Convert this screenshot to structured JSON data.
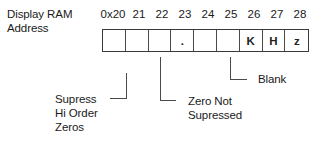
{
  "diagram": {
    "row_label_line1": "Display RAM",
    "row_label_line2": "Address",
    "addresses": [
      "0x20",
      "21",
      "22",
      "23",
      "24",
      "25",
      "26",
      "27",
      "28"
    ],
    "cells": [
      "",
      "",
      "",
      ".",
      "",
      "",
      "K",
      "H",
      "z"
    ],
    "callouts": {
      "supress_hi_order": {
        "line1": "Supress",
        "line2": "Hi Order",
        "line3": "Zeros"
      },
      "zero_not_supressed": {
        "line1": "Zero Not",
        "line2": "Supressed"
      },
      "blank": {
        "line1": "Blank"
      }
    }
  }
}
